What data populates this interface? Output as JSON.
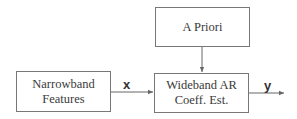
{
  "diagram": {
    "blocks": {
      "a_priori": {
        "lines": [
          "A Priori"
        ]
      },
      "narrowband": {
        "lines": [
          "Narrowband",
          "Features"
        ]
      },
      "wideband": {
        "lines": [
          "Wideband AR",
          "Coeff. Est."
        ]
      }
    },
    "signals": {
      "input": "x",
      "output": "y"
    },
    "edges": [
      {
        "from": "narrowband",
        "to": "wideband",
        "label": "x"
      },
      {
        "from": "a_priori",
        "to": "wideband",
        "label": ""
      },
      {
        "from": "wideband",
        "to": "output",
        "label": "y"
      }
    ],
    "colors": {
      "line": "#666666",
      "border": "#777777",
      "text": "#3a3a3a"
    }
  }
}
